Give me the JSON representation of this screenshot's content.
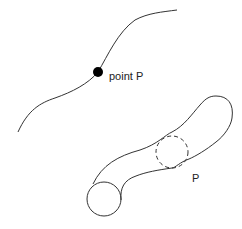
{
  "diagram": {
    "labels": {
      "point_label": "point P",
      "tube_label": "P"
    },
    "colors": {
      "stroke": "#333333",
      "dot": "#000000",
      "background": "#ffffff"
    },
    "elements": [
      {
        "type": "curve",
        "name": "space-curve"
      },
      {
        "type": "point",
        "name": "point-P",
        "label": "point P"
      },
      {
        "type": "tube",
        "name": "tubular-neighborhood",
        "label": "P"
      },
      {
        "type": "circle",
        "name": "end-cross-section",
        "style": "solid"
      },
      {
        "type": "circle",
        "name": "mid-cross-section",
        "style": "dashed"
      }
    ]
  }
}
